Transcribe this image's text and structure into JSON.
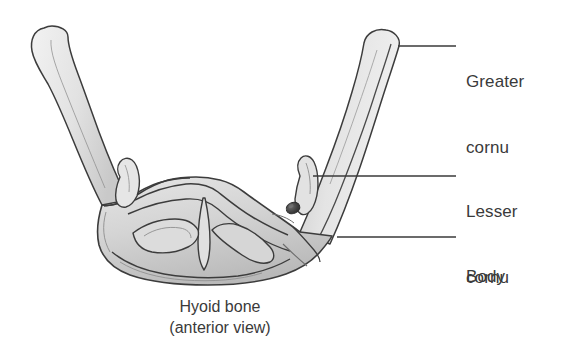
{
  "figure": {
    "title": "Hyoid bone",
    "view": "(anterior view)",
    "caption": "Hyoid bone\n(anterior view)",
    "background_color": "#ffffff",
    "ink_color": "#3a3a3a",
    "bone_fill_light": "#ececec",
    "bone_fill_mid": "#d2d2d2",
    "bone_fill_dark": "#b4b4b4",
    "outline_color": "#3c3c3c"
  },
  "labels": [
    {
      "id": "greater-cornu",
      "line1": "Greater",
      "line2": "cornu",
      "text": "Greater cornu",
      "leader": {
        "x1": 398,
        "y1": 46,
        "x2": 456,
        "y2": 46
      }
    },
    {
      "id": "lesser-cornu",
      "line1": "Lesser",
      "line2": "cornu",
      "text": "Lesser cornu",
      "leader": {
        "x1": 313,
        "y1": 176,
        "x2": 456,
        "y2": 176
      }
    },
    {
      "id": "body",
      "line1": "Body",
      "line2": "",
      "text": "Body",
      "leader": {
        "x1": 337,
        "y1": 237,
        "x2": 456,
        "y2": 237
      }
    }
  ],
  "parts": {
    "left_greater_cornu": "left-greater-cornu",
    "right_greater_cornu": "right-greater-cornu",
    "left_lesser_cornu": "left-lesser-cornu",
    "right_lesser_cornu": "right-lesser-cornu",
    "body": "hyoid-body",
    "foramen": "body-foramen",
    "median_crest": "median-crest"
  }
}
